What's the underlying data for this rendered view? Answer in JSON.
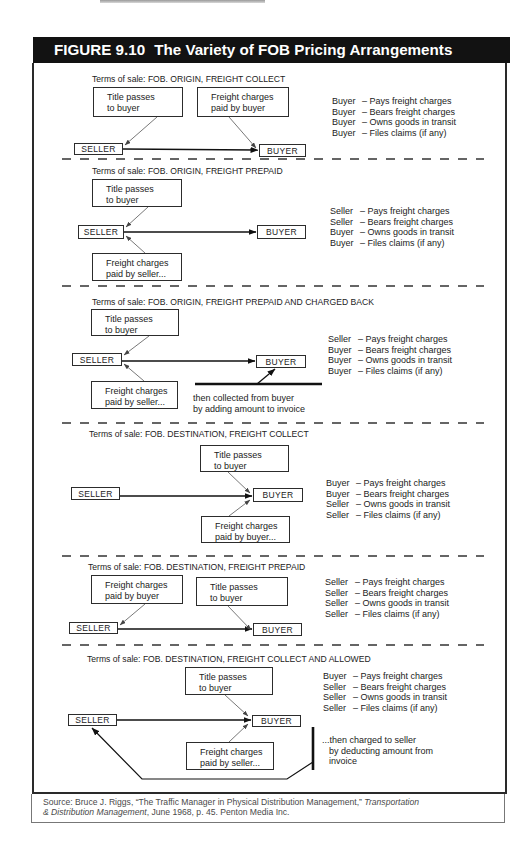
{
  "figure": {
    "label": "FIGURE 9.10",
    "title": "The Variety of FOB Pricing Arrangements",
    "sections": [
      {
        "terms": "Terms of sale: FOB. ORIGIN, FREIGHT COLLECT",
        "title_box": {
          "line1": "Title passes",
          "line2": "to buyer"
        },
        "freight_box": {
          "line1": "Freight charges",
          "line2": "paid by buyer"
        },
        "seller": "SELLER",
        "buyer": "BUYER",
        "responsibilities": [
          {
            "party": "Buyer",
            "duty": "– Pays freight charges"
          },
          {
            "party": "Buyer",
            "duty": "– Bears freight charges"
          },
          {
            "party": "Buyer",
            "duty": "– Owns goods in transit"
          },
          {
            "party": "Buyer",
            "duty": "– Files claims (if any)"
          }
        ]
      },
      {
        "terms": "Terms of sale: FOB. ORIGIN, FREIGHT PREPAID",
        "title_box": {
          "line1": "Title passes",
          "line2": "to buyer"
        },
        "freight_box": {
          "line1": "Freight charges",
          "line2": "paid by seller..."
        },
        "seller": "SELLER",
        "buyer": "BUYER",
        "responsibilities": [
          {
            "party": "Seller",
            "duty": "– Pays freight charges"
          },
          {
            "party": "Seller",
            "duty": "– Bears freight charges"
          },
          {
            "party": "Buyer",
            "duty": "– Owns goods in transit"
          },
          {
            "party": "Buyer",
            "duty": "– Files claims (if any)"
          }
        ]
      },
      {
        "terms": "Terms of sale: FOB. ORIGIN, FREIGHT PREPAID AND CHARGED BACK",
        "title_box": {
          "line1": "Title passes",
          "line2": "to buyer"
        },
        "freight_box": {
          "line1": "Freight charges",
          "line2": "paid by seller..."
        },
        "seller": "SELLER",
        "buyer": "BUYER",
        "note": {
          "line1": "then collected from buyer",
          "line2": "by adding amount to invoice"
        },
        "responsibilities": [
          {
            "party": "Seller",
            "duty": "– Pays freight charges"
          },
          {
            "party": "Buyer",
            "duty": "– Bears freight charges"
          },
          {
            "party": "Buyer",
            "duty": "– Owns goods in transit"
          },
          {
            "party": "Buyer",
            "duty": "– Files claims (if any)"
          }
        ]
      },
      {
        "terms": "Terms of sale: FOB. DESTINATION, FREIGHT COLLECT",
        "title_box": {
          "line1": "Title passes",
          "line2": "to buyer"
        },
        "freight_box": {
          "line1": "Freight charges",
          "line2": "paid by buyer..."
        },
        "seller": "SELLER",
        "buyer": "BUYER",
        "responsibilities": [
          {
            "party": "Buyer",
            "duty": "– Pays freight charges"
          },
          {
            "party": "Buyer",
            "duty": "– Bears freight charges"
          },
          {
            "party": "Seller",
            "duty": "– Owns goods in transit"
          },
          {
            "party": "Seller",
            "duty": "– Files claims (if any)"
          }
        ]
      },
      {
        "terms": "Terms of sale: FOB. DESTINATION, FREIGHT PREPAID",
        "title_box": {
          "line1": "Title passes",
          "line2": "to buyer"
        },
        "freight_box": {
          "line1": "Freight charges",
          "line2": "paid by buyer"
        },
        "seller": "SELLER",
        "buyer": "BUYER",
        "responsibilities": [
          {
            "party": "Seller",
            "duty": "– Pays freight charges"
          },
          {
            "party": "Seller",
            "duty": "– Bears freight charges"
          },
          {
            "party": "Seller",
            "duty": "– Owns goods in transit"
          },
          {
            "party": "Seller",
            "duty": "– Files claims (if any)"
          }
        ]
      },
      {
        "terms": "Terms of sale: FOB. DESTINATION, FREIGHT COLLECT AND ALLOWED",
        "title_box": {
          "line1": "Title passes",
          "line2": "to buyer"
        },
        "freight_box": {
          "line1": "Freight charges",
          "line2": "paid by seller..."
        },
        "seller": "SELLER",
        "buyer": "BUYER",
        "note": {
          "line1": "...then charged to seller",
          "line2": "by deducting amount from",
          "line3": "invoice"
        },
        "responsibilities": [
          {
            "party": "Buyer",
            "duty": "– Pays freight charges"
          },
          {
            "party": "Seller",
            "duty": "– Bears freight charges"
          },
          {
            "party": "Seller",
            "duty": "– Owns goods in transit"
          },
          {
            "party": "Seller",
            "duty": "– Files claims (if any)"
          }
        ]
      }
    ]
  },
  "source": {
    "prefix": "Source: Bruce J. Riggs, “The Traffic Manager in Physical Distribution Management,” ",
    "journal_part1": "Transportation",
    "journal_part2": "& Distribution Management",
    "suffix": ", June 1968, p. 45. Penton Media Inc."
  }
}
